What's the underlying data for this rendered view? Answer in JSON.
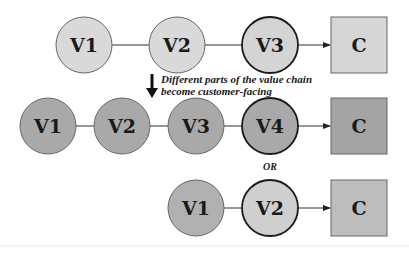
{
  "colors": {
    "light_fill": "#d9d9d9",
    "medium_fill": "#a9a9a9",
    "stroke": "#555555",
    "strong_stroke": "#1a1a1a"
  },
  "rows": [
    {
      "nodes": [
        {
          "label": "V1",
          "shape": "circle"
        },
        {
          "label": "V2",
          "shape": "circle"
        },
        {
          "label": "V3",
          "shape": "circle",
          "customer_facing": true
        },
        {
          "label": "C",
          "shape": "square"
        }
      ]
    },
    {
      "nodes": [
        {
          "label": "V1",
          "shape": "circle"
        },
        {
          "label": "V2",
          "shape": "circle"
        },
        {
          "label": "V3",
          "shape": "circle"
        },
        {
          "label": "V4",
          "shape": "circle",
          "customer_facing": true
        },
        {
          "label": "C",
          "shape": "square"
        }
      ]
    },
    {
      "nodes": [
        {
          "label": "V1",
          "shape": "circle"
        },
        {
          "label": "V2",
          "shape": "circle",
          "customer_facing": true
        },
        {
          "label": "C",
          "shape": "square"
        }
      ]
    }
  ],
  "annotation": {
    "line1": "Different parts of the value chain",
    "line2": "become customer-facing",
    "icon": "down-arrow-icon"
  },
  "separator": {
    "label": "OR"
  }
}
